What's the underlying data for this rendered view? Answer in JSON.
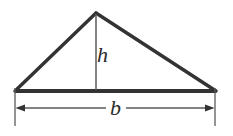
{
  "figure": {
    "name": "triangle-with-base-and-height",
    "background_color": "#ffffff",
    "stroke_color": "#333333",
    "thin_stroke_color": "#555555",
    "label_color": "#2b2b2b"
  },
  "labels": {
    "height": "h",
    "base": "b"
  },
  "geometry": {
    "apex": {
      "x": 96,
      "y": 13
    },
    "bottom_left": {
      "x": 15,
      "y": 91
    },
    "bottom_right": {
      "x": 216,
      "y": 91
    },
    "height_line": {
      "x": 96,
      "y1": 13,
      "y2": 91
    },
    "dimension_line": {
      "y": 108,
      "x1": 15,
      "x2": 215
    },
    "extension_left": {
      "x": 15,
      "y1": 88,
      "y2": 126
    },
    "extension_right": {
      "x": 215,
      "y1": 88,
      "y2": 126
    },
    "label_gap": {
      "x1": 106,
      "x2": 126
    }
  }
}
